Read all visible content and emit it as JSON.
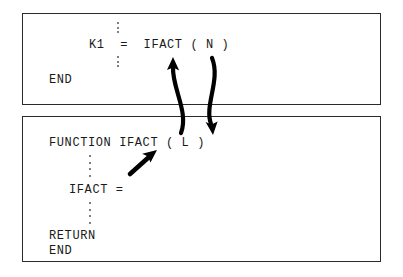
{
  "diagram": {
    "background_color": "#ffffff",
    "border_color": "#2a2a2a",
    "text_color": "#1a1a1a",
    "arrow_color": "#000000"
  },
  "caller_box": {
    "name": "calling-program-box",
    "lines": {
      "call_statement": "K1  =  IFACT ( N )",
      "end_statement": "END"
    }
  },
  "function_box": {
    "name": "function-subprogram-box",
    "lines": {
      "function_header": "FUNCTION IFACT ( L )",
      "assignment": "IFACT =",
      "return_statement": "RETURN",
      "end_statement": "END"
    }
  },
  "ellipses": {
    "caller_above_call": "⋮",
    "caller_below_call": "⋮",
    "function_after_header": "⋮",
    "function_before_return": "⋮"
  },
  "arrows": {
    "call_linkage": {
      "label": "argument-passing-arrow",
      "direction": "down",
      "from": "N in calling program",
      "to": "L in FUNCTION IFACT"
    },
    "return_linkage": {
      "label": "function-name-return-arrow",
      "direction": "up",
      "from": "FUNCTION IFACT definition",
      "to": "IFACT reference in calling program"
    },
    "value_assignment": {
      "label": "return-value-arrow",
      "direction": "up-right",
      "from": "IFACT = assignment",
      "to": "IFACT function name"
    }
  }
}
